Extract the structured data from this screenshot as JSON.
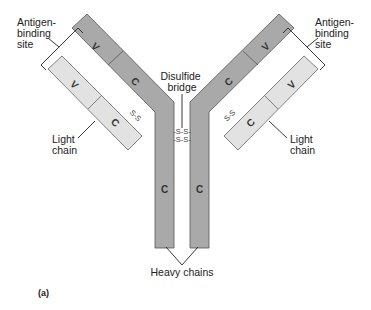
{
  "figure": {
    "panel_label": "(a)",
    "colors": {
      "heavy_chain": "#a9a9a9",
      "light_chain": "#e2e2e2",
      "outline": "#555555",
      "text": "#222222"
    }
  },
  "labels": {
    "antigen_site_left": [
      "Antigen-",
      "binding",
      "site"
    ],
    "antigen_site_right": [
      "Antigen-",
      "binding",
      "site"
    ],
    "disulfide_bridge": [
      "Disulfide",
      "bridge"
    ],
    "light_chain_left": [
      "Light",
      "chain"
    ],
    "light_chain_right": [
      "Light",
      "chain"
    ],
    "heavy_chains": "Heavy chains"
  },
  "segments": {
    "heavy_left_v": "V",
    "heavy_left_c_arm": "C",
    "heavy_left_c_stem": "C",
    "heavy_right_v": "V",
    "heavy_right_c_arm": "C",
    "heavy_right_c_stem": "C",
    "light_left_v": "V",
    "light_left_c": "C",
    "light_right_v": "V",
    "light_right_c": "C"
  },
  "bonds": {
    "hinge_top": "-S-S-",
    "hinge_bottom": "-S-S-",
    "light_heavy_left": "S-S",
    "light_heavy_right": "S-S"
  }
}
